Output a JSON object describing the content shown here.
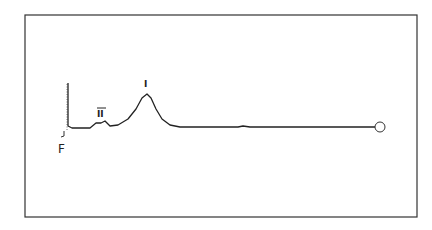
{
  "figure": {
    "type": "chromatogram-trace",
    "labels": {
      "peak_major": "I",
      "peak_minor": "II",
      "start_marker": "F",
      "end_marker": "O"
    }
  },
  "chart_data": {
    "type": "line",
    "title": "",
    "xlabel": "",
    "ylabel": "",
    "grid": false,
    "annotations": [
      {
        "text": "F",
        "position": "start, below baseline"
      },
      {
        "text": "II",
        "position": "minor peak"
      },
      {
        "text": "I",
        "position": "major peak"
      },
      {
        "text": "O",
        "position": "end of trace (circle)"
      }
    ],
    "series": [
      {
        "name": "trace",
        "points": [
          [
            68,
            83
          ],
          [
            68,
            126
          ],
          [
            72,
            128
          ],
          [
            82,
            128
          ],
          [
            90,
            128
          ],
          [
            96,
            123
          ],
          [
            101,
            123
          ],
          [
            105,
            121
          ],
          [
            110,
            126
          ],
          [
            118,
            125
          ],
          [
            128,
            119
          ],
          [
            136,
            109
          ],
          [
            142,
            98
          ],
          [
            147,
            94
          ],
          [
            151,
            98
          ],
          [
            156,
            109
          ],
          [
            162,
            119
          ],
          [
            170,
            125
          ],
          [
            180,
            127
          ],
          [
            238,
            127
          ],
          [
            243,
            126
          ],
          [
            250,
            127
          ],
          [
            300,
            127
          ],
          [
            375,
            127
          ]
        ]
      }
    ]
  }
}
